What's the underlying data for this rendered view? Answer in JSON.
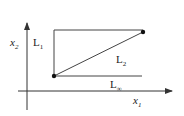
{
  "diagram": {
    "colors": {
      "stroke": "#333333",
      "text": "#222222",
      "background": "#ffffff"
    },
    "axes": {
      "x_label": "x",
      "x_sub": "1",
      "y_label": "x",
      "y_sub": "2"
    },
    "labels": {
      "l1": {
        "text": "L",
        "sub": "1"
      },
      "l2": {
        "text": "L",
        "sub": "2"
      },
      "linf": {
        "text": "L",
        "sub": "∞"
      }
    },
    "points": [
      {
        "name": "point-a",
        "x": 54,
        "y": 76
      },
      {
        "name": "point-b",
        "x": 143,
        "y": 32
      }
    ]
  }
}
